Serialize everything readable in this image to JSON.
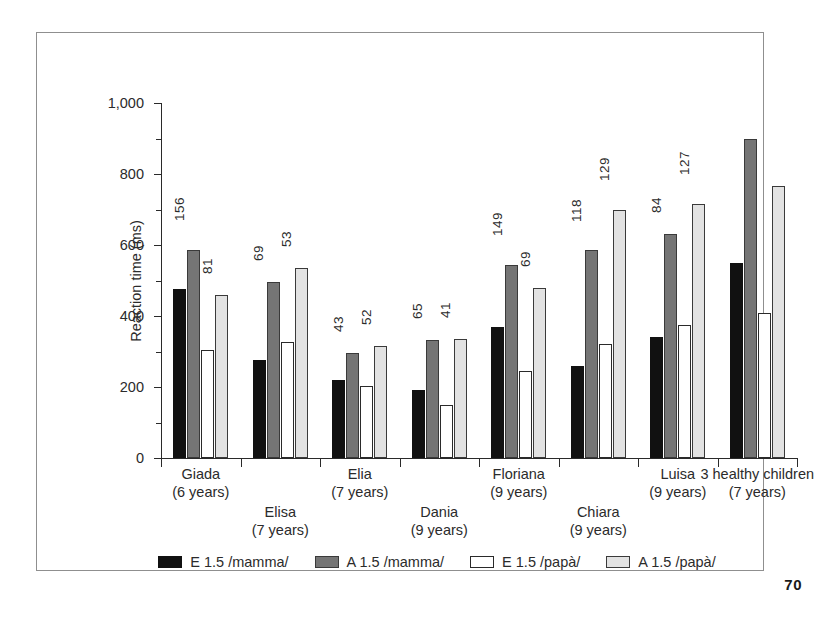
{
  "page_number": "70",
  "chart_data": {
    "type": "bar",
    "title": "",
    "xlabel": "",
    "ylabel": "Reaction time (ms)",
    "ylim": [
      0,
      1000
    ],
    "ytick_labels": [
      "0",
      "200",
      "400",
      "600",
      "800",
      "1,000"
    ],
    "ytick_values": [
      0,
      200,
      400,
      600,
      800,
      1000
    ],
    "yminor_values": [
      100,
      300,
      500,
      700,
      900
    ],
    "grid": false,
    "legend_position": "bottom",
    "categories": [
      "Giada (6 years)",
      "Elisa (7 years)",
      "Elia (7 years)",
      "Dania (9 years)",
      "Floriana (9 years)",
      "Chiara (9 years)",
      "Luisa (9 years)",
      "3 healthy children (7 years)"
    ],
    "category_lines": [
      {
        "line1": "Giada",
        "line2": "(6 years)",
        "row": "top"
      },
      {
        "line1": "Elisa",
        "line2": "(7 years)",
        "row": "bottom"
      },
      {
        "line1": "Elia",
        "line2": "(7 years)",
        "row": "top"
      },
      {
        "line1": "Dania",
        "line2": "(9 years)",
        "row": "bottom"
      },
      {
        "line1": "Floriana",
        "line2": "(9 years)",
        "row": "top"
      },
      {
        "line1": "Chiara",
        "line2": "(9 years)",
        "row": "bottom"
      },
      {
        "line1": "Luisa",
        "line2": "(9 years)",
        "row": "top"
      },
      {
        "line1": "3 healthy children",
        "line2": "(7 years)",
        "row": "top"
      }
    ],
    "series": [
      {
        "name": "E 1.5 /mamma/",
        "color": "#111111",
        "values": [
          475,
          277,
          220,
          193,
          370,
          260,
          340,
          548
        ]
      },
      {
        "name": "A 1.5 /mamma/",
        "color": "#757575",
        "values": [
          585,
          495,
          297,
          333,
          545,
          585,
          630,
          898
        ]
      },
      {
        "name": "E 1.5 /papà/",
        "color": "#ffffff",
        "values": [
          305,
          328,
          203,
          150,
          245,
          322,
          375,
          408
        ]
      },
      {
        "name": "A 1.5 /papà/",
        "color": "#e2e2e2",
        "values": [
          458,
          535,
          315,
          335,
          480,
          698,
          715,
          765
        ]
      }
    ],
    "annotations": [
      {
        "category": "Giada (6 years)",
        "labels": [
          "156",
          "81"
        ]
      },
      {
        "category": "Elisa (7 years)",
        "labels": [
          "69",
          "53"
        ]
      },
      {
        "category": "Elia (7 years)",
        "labels": [
          "43",
          "52"
        ]
      },
      {
        "category": "Dania (9 years)",
        "labels": [
          "65",
          "41"
        ]
      },
      {
        "category": "Floriana (9 years)",
        "labels": [
          "149",
          "69"
        ]
      },
      {
        "category": "Chiara (9 years)",
        "labels": [
          "118",
          "129"
        ]
      },
      {
        "category": "Luisa (9 years)",
        "labels": [
          "84",
          "127"
        ]
      },
      {
        "category": "3 healthy children (7 years)",
        "labels": []
      }
    ]
  },
  "legend": {
    "items": [
      {
        "label": "E 1.5 /mamma/",
        "swatch": "s0"
      },
      {
        "label": "A 1.5 /mamma/",
        "swatch": "s1"
      },
      {
        "label": "E 1.5 /papà/",
        "swatch": "s2"
      },
      {
        "label": "A 1.5 /papà/",
        "swatch": "s3"
      }
    ]
  }
}
